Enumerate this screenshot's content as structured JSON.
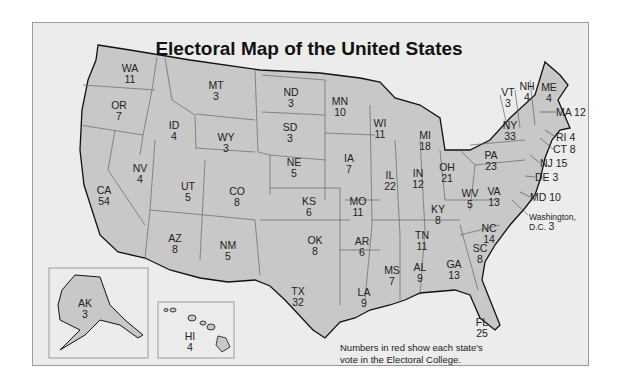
{
  "title": "Electoral Map of the United States",
  "note": [
    "Numbers in red show each state's",
    "vote in the Electoral College."
  ],
  "colors": {
    "background": "#ececec",
    "state_fill": "#c8c8c8",
    "border": "#555555",
    "coast": "#111111"
  },
  "dc": {
    "label": "Washington,",
    "label2": "D.C.",
    "votes": "3"
  },
  "states": [
    {
      "abbr": "WA",
      "votes": "11",
      "x": 130,
      "y": 63
    },
    {
      "abbr": "OR",
      "votes": "7",
      "x": 119,
      "y": 100
    },
    {
      "abbr": "CA",
      "votes": "54",
      "x": 104,
      "y": 185
    },
    {
      "abbr": "ID",
      "votes": "4",
      "x": 174,
      "y": 120
    },
    {
      "abbr": "NV",
      "votes": "4",
      "x": 140,
      "y": 163
    },
    {
      "abbr": "MT",
      "votes": "3",
      "x": 216,
      "y": 80
    },
    {
      "abbr": "WY",
      "votes": "3",
      "x": 226,
      "y": 132
    },
    {
      "abbr": "UT",
      "votes": "5",
      "x": 188,
      "y": 181
    },
    {
      "abbr": "CO",
      "votes": "8",
      "x": 237,
      "y": 186
    },
    {
      "abbr": "AZ",
      "votes": "8",
      "x": 175,
      "y": 233
    },
    {
      "abbr": "NM",
      "votes": "5",
      "x": 228,
      "y": 240
    },
    {
      "abbr": "ND",
      "votes": "3",
      "x": 291,
      "y": 87
    },
    {
      "abbr": "SD",
      "votes": "3",
      "x": 290,
      "y": 122
    },
    {
      "abbr": "NE",
      "votes": "5",
      "x": 294,
      "y": 157
    },
    {
      "abbr": "KS",
      "votes": "6",
      "x": 309,
      "y": 196
    },
    {
      "abbr": "OK",
      "votes": "8",
      "x": 315,
      "y": 235
    },
    {
      "abbr": "TX",
      "votes": "32",
      "x": 298,
      "y": 286
    },
    {
      "abbr": "MN",
      "votes": "10",
      "x": 340,
      "y": 96
    },
    {
      "abbr": "IA",
      "votes": "7",
      "x": 349,
      "y": 153
    },
    {
      "abbr": "MO",
      "votes": "11",
      "x": 358,
      "y": 196
    },
    {
      "abbr": "AR",
      "votes": "6",
      "x": 362,
      "y": 236
    },
    {
      "abbr": "LA",
      "votes": "9",
      "x": 364,
      "y": 287
    },
    {
      "abbr": "WI",
      "votes": "11",
      "x": 380,
      "y": 118
    },
    {
      "abbr": "IL",
      "votes": "22",
      "x": 390,
      "y": 170
    },
    {
      "abbr": "MI",
      "votes": "18",
      "x": 425,
      "y": 130
    },
    {
      "abbr": "IN",
      "votes": "12",
      "x": 418,
      "y": 168
    },
    {
      "abbr": "OH",
      "votes": "21",
      "x": 447,
      "y": 162
    },
    {
      "abbr": "KY",
      "votes": "8",
      "x": 438,
      "y": 204
    },
    {
      "abbr": "TN",
      "votes": "11",
      "x": 422,
      "y": 230
    },
    {
      "abbr": "MS",
      "votes": "7",
      "x": 392,
      "y": 265
    },
    {
      "abbr": "AL",
      "votes": "9",
      "x": 420,
      "y": 262
    },
    {
      "abbr": "GA",
      "votes": "13",
      "x": 454,
      "y": 259
    },
    {
      "abbr": "FL",
      "votes": "25",
      "x": 482,
      "y": 317
    },
    {
      "abbr": "SC",
      "votes": "8",
      "x": 480,
      "y": 243
    },
    {
      "abbr": "NC",
      "votes": "14",
      "x": 489,
      "y": 223
    },
    {
      "abbr": "VA",
      "votes": "13",
      "x": 494,
      "y": 186
    },
    {
      "abbr": "WV",
      "votes": "5",
      "x": 470,
      "y": 188
    },
    {
      "abbr": "PA",
      "votes": "23",
      "x": 491,
      "y": 150
    },
    {
      "abbr": "NY",
      "votes": "33",
      "x": 510,
      "y": 120
    },
    {
      "abbr": "VT",
      "votes": "3",
      "x": 508,
      "y": 87
    },
    {
      "abbr": "NH",
      "votes": "4",
      "x": 527,
      "y": 81
    },
    {
      "abbr": "ME",
      "votes": "4",
      "x": 549,
      "y": 82
    },
    {
      "abbr": "AK",
      "votes": "3",
      "x": 85,
      "y": 298
    },
    {
      "abbr": "HI",
      "votes": "4",
      "x": 190,
      "y": 331
    }
  ],
  "callouts": [
    {
      "abbr": "MA",
      "votes": "12",
      "x": 556,
      "y": 107
    },
    {
      "abbr": "RI",
      "votes": "4",
      "x": 556,
      "y": 132
    },
    {
      "abbr": "CT",
      "votes": "8",
      "x": 553,
      "y": 144
    },
    {
      "abbr": "NJ",
      "votes": "15",
      "x": 540,
      "y": 158
    },
    {
      "abbr": "DE",
      "votes": "3",
      "x": 535,
      "y": 172
    },
    {
      "abbr": "MD",
      "votes": "10",
      "x": 530,
      "y": 192
    }
  ]
}
